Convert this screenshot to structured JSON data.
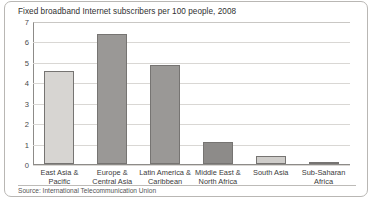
{
  "chart_data": {
    "type": "bar",
    "title": "Fixed broadband Internet subscribers per 100 people, 2008",
    "xlabel": "",
    "ylabel": "",
    "ylim": [
      0,
      7
    ],
    "yticks": [
      0,
      1,
      2,
      3,
      4,
      5,
      6,
      7
    ],
    "grid": true,
    "legend": false,
    "source": "Source: International Telecommunication Union",
    "categories": [
      "East Asia &\nPacific",
      "Europe &\nCentral Asia",
      "Latin America &\nCaribbean",
      "Middle East &\nNorth Africa",
      "South Asia",
      "Sub-Saharan\nAfrica"
    ],
    "values": [
      4.6,
      6.4,
      4.9,
      1.1,
      0.4,
      0.1
    ],
    "bar_colors": [
      "#d7d5d2",
      "#9a9896",
      "#9a9896",
      "#8d8b89",
      "#cfcdca",
      "#8d8b89"
    ]
  },
  "style": {
    "grid_color": "#d9d7d4",
    "axis_color": "#8d8b88",
    "border_color": "#b9b7b4",
    "text_color": "#333333"
  }
}
